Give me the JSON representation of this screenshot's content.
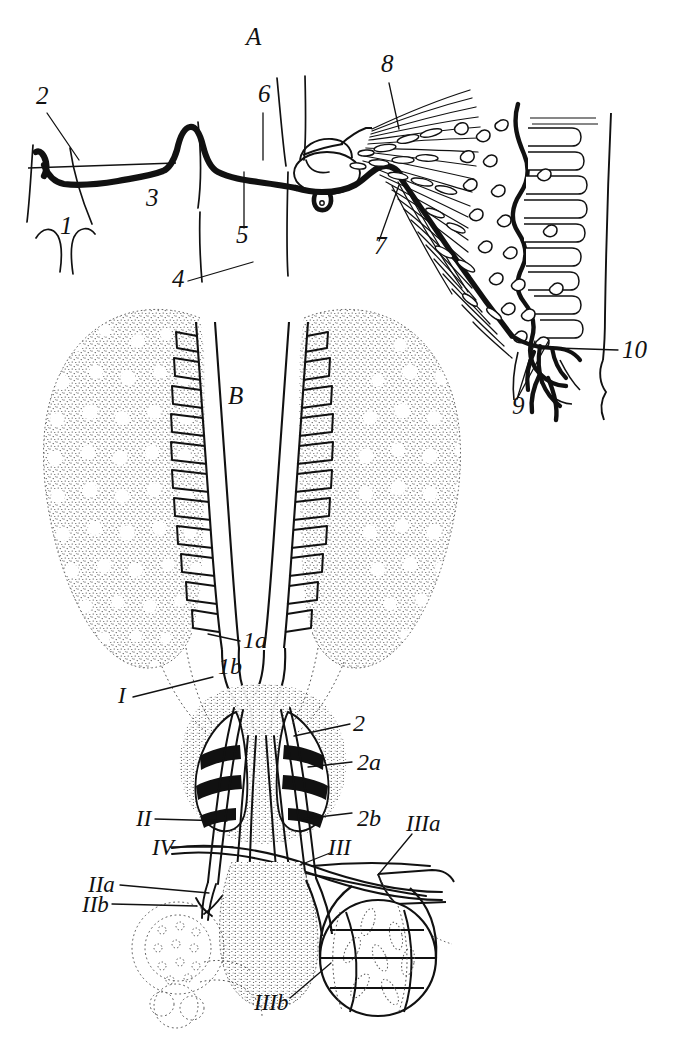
{
  "figure": {
    "type": "scientific-anatomical-line-drawing",
    "background_color": "#ffffff",
    "ink_color": "#111111",
    "panels": [
      {
        "id": "A",
        "label": "A",
        "label_pos": {
          "x": 246,
          "y": 45
        },
        "description": "Lateral view: a dark beaded longitudinal cord running left to right, passing a rounded ganglion, terminating in a fan of radiating fibres with granular cells at right"
      },
      {
        "id": "B",
        "label": "B",
        "label_pos": {
          "x": 236,
          "y": 404
        },
        "description": "Ventral view: paired stippled lobes with ladder-like lateral branches converging on paired dark-banded organs, with nerve trunks running to two terminal vesicles"
      }
    ],
    "panel_a_labels": [
      {
        "text": "2",
        "x": 36,
        "y": 104,
        "leader": [
          [
            46,
            112
          ],
          [
            78,
            158
          ]
        ]
      },
      {
        "text": "1",
        "x": 60,
        "y": 234,
        "leader": null
      },
      {
        "text": "3",
        "x": 146,
        "y": 206,
        "leader": null
      },
      {
        "text": "A",
        "x": 246,
        "y": 45,
        "leader": null
      },
      {
        "text": "6",
        "x": 258,
        "y": 102,
        "leader": [
          [
            262,
            112
          ],
          [
            262,
            158
          ]
        ]
      },
      {
        "text": "5",
        "x": 236,
        "y": 243,
        "leader": [
          [
            243,
            228
          ],
          [
            243,
            172
          ]
        ]
      },
      {
        "text": "4",
        "x": 172,
        "y": 287,
        "leader": [
          [
            188,
            280
          ],
          [
            252,
            262
          ]
        ]
      },
      {
        "text": "7",
        "x": 374,
        "y": 254,
        "leader": [
          [
            378,
            240
          ],
          [
            398,
            184
          ]
        ]
      },
      {
        "text": "8",
        "x": 381,
        "y": 72,
        "leader": [
          [
            388,
            82
          ],
          [
            398,
            128
          ]
        ]
      },
      {
        "text": "9",
        "x": 512,
        "y": 414,
        "leader": [
          [
            516,
            398
          ],
          [
            534,
            340
          ]
        ]
      },
      {
        "text": "10",
        "x": 622,
        "y": 358,
        "leader": [
          [
            618,
            350
          ],
          [
            556,
            348
          ]
        ]
      }
    ],
    "panel_b_labels": [
      {
        "text": "1a",
        "x": 243,
        "y": 648,
        "leader": [
          [
            240,
            641
          ],
          [
            208,
            634
          ]
        ]
      },
      {
        "text": "1b",
        "x": 222,
        "y": 672,
        "leader": null
      },
      {
        "text": "I",
        "x": 120,
        "y": 702,
        "leader": [
          [
            132,
            696
          ],
          [
            212,
            676
          ]
        ]
      },
      {
        "text": "2",
        "x": 355,
        "y": 728,
        "leader": [
          [
            350,
            723
          ],
          [
            294,
            735
          ]
        ]
      },
      {
        "text": "2a",
        "x": 357,
        "y": 767,
        "leader": [
          [
            352,
            761
          ],
          [
            308,
            766
          ]
        ]
      },
      {
        "text": "2b",
        "x": 357,
        "y": 818,
        "leader": [
          [
            352,
            812
          ],
          [
            302,
            818
          ]
        ]
      },
      {
        "text": "II",
        "x": 140,
        "y": 824,
        "leader": [
          [
            154,
            818
          ],
          [
            226,
            820
          ]
        ]
      },
      {
        "text": "IV",
        "x": 155,
        "y": 852,
        "leader": [
          [
            170,
            846
          ],
          [
            232,
            846
          ]
        ]
      },
      {
        "text": "III",
        "x": 333,
        "y": 848,
        "leader": [
          [
            330,
            852
          ],
          [
            300,
            864
          ]
        ]
      },
      {
        "text": "IIIa",
        "x": 412,
        "y": 826,
        "leader": [
          [
            412,
            833
          ],
          [
            378,
            874
          ]
        ]
      },
      {
        "text": "IIa",
        "x": 93,
        "y": 888,
        "leader": [
          [
            120,
            884
          ],
          [
            208,
            892
          ]
        ]
      },
      {
        "text": "IIb",
        "x": 88,
        "y": 908,
        "leader": [
          [
            112,
            903
          ],
          [
            196,
            905
          ]
        ]
      },
      {
        "text": "IIIb",
        "x": 262,
        "y": 1004,
        "leader": [
          [
            290,
            997
          ],
          [
            330,
            962
          ]
        ]
      }
    ]
  }
}
